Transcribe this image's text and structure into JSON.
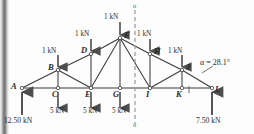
{
  "figure": {
    "type": "truss-free-body-diagram",
    "angle_annotation": "α = 28.1°",
    "section_label_top": "n",
    "section_label_bottom": "n"
  },
  "nodes": {
    "bottom_chord": [
      {
        "id": "A",
        "label": "A",
        "x": 22,
        "y": 88
      },
      {
        "id": "C",
        "label": "C",
        "x": 58,
        "y": 88
      },
      {
        "id": "E",
        "label": "E",
        "x": 91,
        "y": 88
      },
      {
        "id": "G",
        "label": "G",
        "x": 120,
        "y": 88
      },
      {
        "id": "I",
        "label": "I",
        "x": 150,
        "y": 88
      },
      {
        "id": "K",
        "label": "K",
        "x": 182,
        "y": 88
      },
      {
        "id": "L",
        "label": "L",
        "x": 212,
        "y": 88
      }
    ],
    "top_chord": [
      {
        "id": "B",
        "label": "B",
        "x": 58,
        "y": 70
      },
      {
        "id": "D",
        "label": "D",
        "x": 91,
        "y": 54
      },
      {
        "id": "F",
        "label": "F",
        "x": 120,
        "y": 38
      },
      {
        "id": "H",
        "label": "H",
        "x": 150,
        "y": 54
      },
      {
        "id": "J",
        "label": "J",
        "x": 182,
        "y": 70
      }
    ]
  },
  "loads": {
    "top_chord_loads": [
      {
        "node": "B",
        "label": "1 kN",
        "value": 1,
        "unit": "kN",
        "direction": "down"
      },
      {
        "node": "D",
        "label": "1 kN",
        "value": 1,
        "unit": "kN",
        "direction": "down"
      },
      {
        "node": "F",
        "label": "1 kN",
        "value": 1,
        "unit": "kN",
        "direction": "down"
      },
      {
        "node": "H",
        "label": "1 kN",
        "value": 1,
        "unit": "kN",
        "direction": "down"
      },
      {
        "node": "J",
        "label": "1 kN",
        "value": 1,
        "unit": "kN",
        "direction": "down"
      }
    ],
    "bottom_chord_loads": [
      {
        "node": "C",
        "label": "5 kN",
        "value": 5,
        "unit": "kN",
        "direction": "down"
      },
      {
        "node": "E",
        "label": "5 kN",
        "value": 5,
        "unit": "kN",
        "direction": "down"
      },
      {
        "node": "G",
        "label": "5 kN",
        "value": 5,
        "unit": "kN",
        "direction": "down"
      }
    ]
  },
  "reactions": [
    {
      "node": "A",
      "label": "12.50 kN",
      "value": 12.5,
      "unit": "kN",
      "direction": "up"
    },
    {
      "node": "L",
      "label": "7.50 kN",
      "value": 7.5,
      "unit": "kN",
      "direction": "up"
    }
  ],
  "colors": {
    "member": "#3a3a3a",
    "arrow": "#555555",
    "section_line": "#9aa0a6",
    "text": "#2b2b2b",
    "background": "#fdfdfd"
  }
}
